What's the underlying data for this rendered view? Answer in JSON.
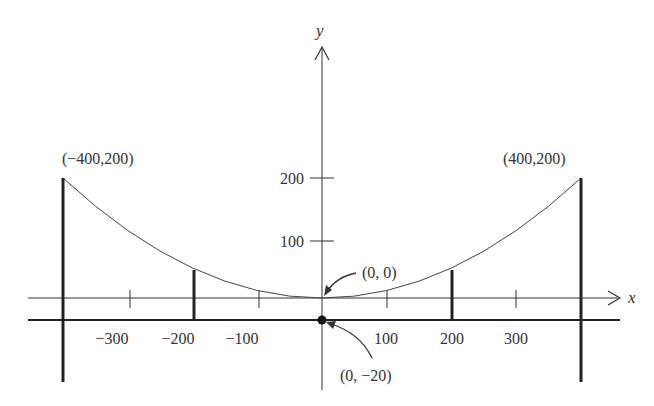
{
  "diagram": {
    "type": "parabolic-cable-diagram",
    "axes": {
      "x_label": "x",
      "y_label": "y"
    },
    "x_ticks": [
      {
        "value": -300,
        "label": "−300"
      },
      {
        "value": -200,
        "label": "−200"
      },
      {
        "value": -100,
        "label": "−100"
      },
      {
        "value": 100,
        "label": "100"
      },
      {
        "value": 200,
        "label": "200"
      },
      {
        "value": 300,
        "label": "300"
      }
    ],
    "y_ticks": [
      {
        "value": 100,
        "label": "100"
      },
      {
        "value": 200,
        "label": "200"
      }
    ],
    "points": {
      "left_top": "(−400,200)",
      "right_top": "(400,200)",
      "vertex": "(0, 0)",
      "road_origin": "(0, −20)"
    },
    "curve": {
      "equation": "y = x^2 / 800",
      "x_range": [
        -400,
        400
      ]
    },
    "colors": {
      "line": "#2a2a2a",
      "text": "#333333",
      "background": "#ffffff"
    }
  }
}
